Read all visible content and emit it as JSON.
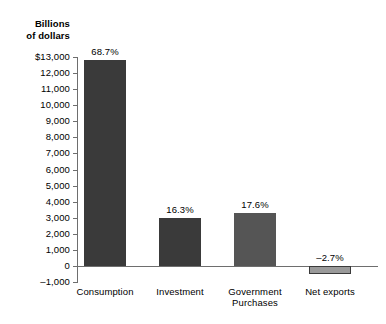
{
  "chart_data": {
    "type": "bar",
    "title": "",
    "subtitle": "",
    "xlabel": "",
    "ylabel": "Billions\nof dollars",
    "ylim": [
      -1000,
      13000
    ],
    "ytick_step": 1000,
    "grid": false,
    "legend": "none",
    "categories": [
      "Consumption",
      "Investment",
      "Government\nPurchases",
      "Net exports"
    ],
    "values": [
      12800,
      3000,
      3270,
      -510
    ],
    "data_labels": [
      "68.7%",
      "16.3%",
      "17.6%",
      "–2.7%"
    ],
    "ytick_labels": [
      "$13,000",
      "12,000",
      "11,000",
      "10,000",
      "9,000",
      "8,000",
      "7,000",
      "6,000",
      "5,000",
      "4,000",
      "3,000",
      "2,000",
      "1,000",
      "0",
      "–1,000"
    ],
    "bar_colors": [
      "#3a3a3a",
      "#3a3a3a",
      "#555555",
      "#9a9a9a"
    ],
    "bar_border_colors": [
      "#3a3a3a",
      "#3a3a3a",
      "#555555",
      "#3a3a3a"
    ],
    "axis_color": "#6e6e6e"
  }
}
